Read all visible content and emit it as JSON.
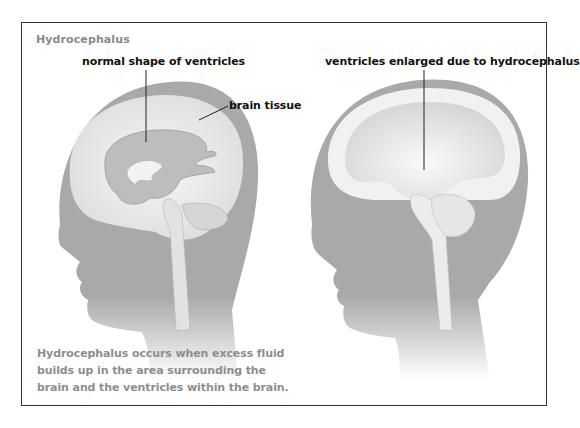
{
  "figure": {
    "title": "Hydrocephalus",
    "labels": {
      "normal_ventricles": "normal shape of ventricles",
      "brain_tissue": "brain tissue",
      "enlarged_ventricles": "ventricles enlarged due to hydrocephalus"
    },
    "caption": "Hydrocephalus occurs when excess fluid builds up in the area surrounding the brain and the ventricles within the brain.",
    "panels": [
      {
        "name": "normal",
        "description": "head profile with normal ventricles"
      },
      {
        "name": "hydrocephalus",
        "description": "head profile with enlarged ventricles"
      }
    ],
    "colors": {
      "silhouette": "#a9a9a9",
      "brain_tissue": "#ececec",
      "ventricle": "#bdbdbd",
      "text_title": "#8a8a8a",
      "text_label": "#111111"
    }
  }
}
